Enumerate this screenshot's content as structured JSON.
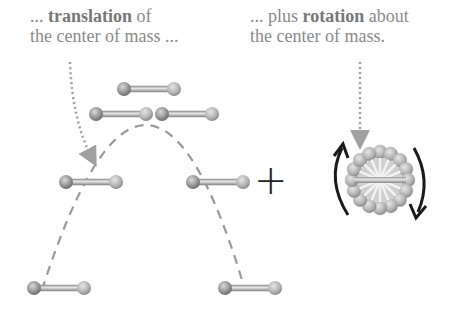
{
  "captions": {
    "left": {
      "line1_prefix": "... ",
      "line1_bold": "translation",
      "line1_suffix": " of",
      "line2": "the center of mass ..."
    },
    "right": {
      "line1_prefix": "... plus ",
      "line1_bold": "rotation",
      "line1_suffix": " about",
      "line2": "the center of mass."
    }
  },
  "operator": "+",
  "colors": {
    "caption_text": "#8a8a8a",
    "ball": "#9a9a9a",
    "rod": "#c8c8c8",
    "dashed_path": "#9a9a9a",
    "dotted_pointer": "#a0a0a0",
    "rotation_arrow": "#1a1a1a"
  },
  "icons": {
    "molecule": "dumbbell-molecule-icon",
    "rotation": "rotation-arrows-icon"
  }
}
